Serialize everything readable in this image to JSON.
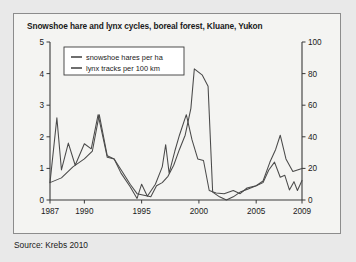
{
  "figure": {
    "title": "Snowshoe hare and lynx cycles, boreal forest, Kluane, Yukon",
    "source": "Source: Krebs 2010",
    "background_color": "#f4f4f2",
    "border_color": "#8c8c8c",
    "line_color": "#4a4a4a"
  },
  "chart_data": {
    "type": "line",
    "title": "Snowshoe hare and lynx cycles, boreal forest, Kluane, Yukon",
    "xlabel": "",
    "ylabel": "",
    "grid": false,
    "legend_position": "top-left",
    "x": [
      1987,
      1988,
      1989,
      1990,
      1991,
      1992,
      1993,
      1994,
      1995,
      1996,
      1997,
      1998,
      1999,
      2000,
      2001,
      2002,
      2003,
      2004,
      2005,
      2006,
      2007,
      2008,
      2009
    ],
    "xlim": [
      1987,
      2009
    ],
    "xticks": [
      1987,
      1990,
      1995,
      2000,
      2005,
      2009
    ],
    "xtick_labels": [
      "1987",
      "1990",
      "1995",
      "2000",
      "2005",
      "2009"
    ],
    "left_axis": {
      "label": "",
      "ylim": [
        0,
        5
      ],
      "yticks": [
        0,
        1,
        2,
        3,
        4,
        5
      ],
      "ytick_labels": [
        "0",
        "1",
        "2",
        "3",
        "4",
        "5"
      ]
    },
    "right_axis": {
      "label": "",
      "ylim": [
        0,
        100
      ],
      "yticks": [
        0,
        20,
        40,
        60,
        80,
        100
      ],
      "ytick_labels": [
        "0",
        "20",
        "40",
        "60",
        "80",
        "100"
      ]
    },
    "series": [
      {
        "name": "snowshoe hares per ha",
        "axis": "left",
        "unit": "hares per ha",
        "values": [
          0.55,
          2.6,
          0.95,
          1.8,
          1.62,
          1.3,
          0.85,
          0.52,
          0.05,
          0.4,
          0.12,
          0.5,
          1.75,
          0.85,
          1.55,
          2.05,
          2.7,
          1.3,
          1.1,
          0.32,
          0.18,
          0.08,
          0.2
        ],
        "detail_values": [
          {
            "x": 1987.0,
            "y": 0.55
          },
          {
            "x": 1987.6,
            "y": 2.6
          },
          {
            "x": 1988.0,
            "y": 0.95
          },
          {
            "x": 1988.6,
            "y": 1.8
          },
          {
            "x": 1989.2,
            "y": 1.1
          },
          {
            "x": 1990.0,
            "y": 1.78
          },
          {
            "x": 1990.6,
            "y": 1.62
          },
          {
            "x": 1991.2,
            "y": 2.7
          },
          {
            "x": 1992.0,
            "y": 1.35
          },
          {
            "x": 1992.6,
            "y": 1.3
          },
          {
            "x": 1993.2,
            "y": 0.85
          },
          {
            "x": 1994.0,
            "y": 0.42
          },
          {
            "x": 1994.6,
            "y": 0.05
          },
          {
            "x": 1995.0,
            "y": 0.5
          },
          {
            "x": 1995.5,
            "y": 0.12
          },
          {
            "x": 1996.2,
            "y": 0.5
          },
          {
            "x": 1996.8,
            "y": 1.05
          },
          {
            "x": 1997.1,
            "y": 1.75
          },
          {
            "x": 1997.4,
            "y": 0.85
          },
          {
            "x": 1997.9,
            "y": 1.55
          },
          {
            "x": 1998.3,
            "y": 2.05
          },
          {
            "x": 1998.9,
            "y": 2.7
          },
          {
            "x": 1999.4,
            "y": 1.9
          },
          {
            "x": 1999.9,
            "y": 1.3
          },
          {
            "x": 2000.4,
            "y": 1.25
          },
          {
            "x": 2000.9,
            "y": 0.3
          },
          {
            "x": 2001.5,
            "y": 0.22
          },
          {
            "x": 2002.2,
            "y": 0.2
          },
          {
            "x": 2003.0,
            "y": 0.3
          },
          {
            "x": 2003.6,
            "y": 0.2
          },
          {
            "x": 2004.2,
            "y": 0.38
          },
          {
            "x": 2005.0,
            "y": 0.45
          },
          {
            "x": 2005.6,
            "y": 0.55
          },
          {
            "x": 2006.1,
            "y": 0.95
          },
          {
            "x": 2006.6,
            "y": 1.2
          },
          {
            "x": 2007.1,
            "y": 0.72
          },
          {
            "x": 2007.5,
            "y": 0.78
          },
          {
            "x": 2007.9,
            "y": 0.32
          },
          {
            "x": 2008.3,
            "y": 0.58
          },
          {
            "x": 2008.6,
            "y": 0.3
          },
          {
            "x": 2009.0,
            "y": 0.62
          }
        ]
      },
      {
        "name": "lynx tracks per 100 km",
        "axis": "right",
        "unit": "tracks per 100 km",
        "values": [
          11,
          14,
          21,
          26,
          33,
          54,
          28,
          18,
          10,
          4,
          2,
          9,
          11,
          22,
          41,
          58,
          83,
          72,
          5,
          2,
          4,
          9,
          20
        ],
        "detail_values": [
          {
            "x": 1987.0,
            "y": 11
          },
          {
            "x": 1988.0,
            "y": 14
          },
          {
            "x": 1989.0,
            "y": 21
          },
          {
            "x": 1990.0,
            "y": 26
          },
          {
            "x": 1990.7,
            "y": 31
          },
          {
            "x": 1991.3,
            "y": 54
          },
          {
            "x": 1992.0,
            "y": 28
          },
          {
            "x": 1992.6,
            "y": 26
          },
          {
            "x": 1993.3,
            "y": 18
          },
          {
            "x": 1994.0,
            "y": 10
          },
          {
            "x": 1994.6,
            "y": 4
          },
          {
            "x": 1995.2,
            "y": 3
          },
          {
            "x": 1995.8,
            "y": 2
          },
          {
            "x": 1996.3,
            "y": 9
          },
          {
            "x": 1996.8,
            "y": 11
          },
          {
            "x": 1997.3,
            "y": 15
          },
          {
            "x": 1997.8,
            "y": 22
          },
          {
            "x": 1998.3,
            "y": 32
          },
          {
            "x": 1998.8,
            "y": 41
          },
          {
            "x": 1999.3,
            "y": 58
          },
          {
            "x": 1999.6,
            "y": 83
          },
          {
            "x": 2000.3,
            "y": 79
          },
          {
            "x": 2000.8,
            "y": 72
          },
          {
            "x": 2001.2,
            "y": 5
          },
          {
            "x": 2001.8,
            "y": 2
          },
          {
            "x": 2002.4,
            "y": 0
          },
          {
            "x": 2003.0,
            "y": 2
          },
          {
            "x": 2003.6,
            "y": 5
          },
          {
            "x": 2004.3,
            "y": 7
          },
          {
            "x": 2005.0,
            "y": 9
          },
          {
            "x": 2005.6,
            "y": 12
          },
          {
            "x": 2006.2,
            "y": 24
          },
          {
            "x": 2006.7,
            "y": 32
          },
          {
            "x": 2007.1,
            "y": 41
          },
          {
            "x": 2007.6,
            "y": 26
          },
          {
            "x": 2008.2,
            "y": 18
          },
          {
            "x": 2008.6,
            "y": 19
          },
          {
            "x": 2009.0,
            "y": 20
          }
        ]
      }
    ]
  }
}
